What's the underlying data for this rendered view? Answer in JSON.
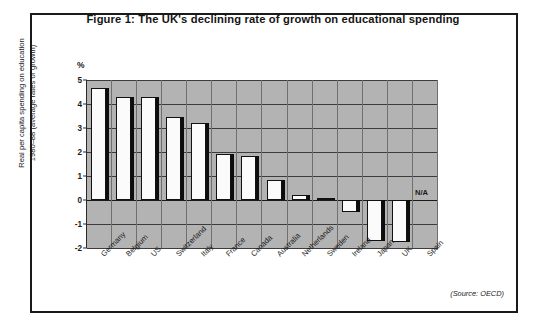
{
  "figure": {
    "title": "Figure 1: The UK's declining rate of growth on educational spending",
    "source_note": "(Source: OECD)",
    "percent_symbol": "%",
    "y_axis_title_line1": "Real per capita spending on education",
    "y_axis_title_line2": "1980–88 (average rates of growth)",
    "na_label": "N/A"
  },
  "chart_data": {
    "type": "bar",
    "title": "Figure 1: The UK's declining rate of growth on educational spending",
    "xlabel": "",
    "ylabel": "Real per capita spending on education 1980–88 (average rates of growth)",
    "yunit": "%",
    "ylim": [
      -2,
      5
    ],
    "yticks": [
      5,
      4,
      3,
      2,
      1,
      0,
      -1,
      -2
    ],
    "ytick_labels": [
      "5",
      "4",
      "3",
      "2",
      "1",
      "0",
      "-1",
      "-2"
    ],
    "grid": true,
    "legend": false,
    "annotations": [
      {
        "category": "Spain",
        "text": "N/A",
        "note": "no data available"
      }
    ],
    "source": "OECD",
    "categories": [
      "Germany",
      "Belgium",
      "US",
      "Switzerland",
      "Italy",
      "France",
      "Canada",
      "Australia",
      "Netherlands",
      "Sweden",
      "Ireland",
      "Japan",
      "UK",
      "Spain"
    ],
    "values": [
      4.65,
      4.3,
      4.3,
      3.45,
      3.2,
      1.9,
      1.85,
      0.85,
      0.2,
      0.1,
      -0.5,
      -1.7,
      -1.75,
      null
    ]
  }
}
